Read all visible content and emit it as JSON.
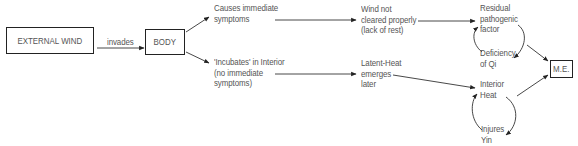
{
  "diagram": {
    "nodes": {
      "external_wind": "EXTERNAL WIND",
      "body": "BODY",
      "me": "M.E."
    },
    "edge_labels": {
      "invades": "invades"
    },
    "branch_upper": {
      "step1": "Causes immediate\nsymptoms",
      "step2": "Wind not\ncleared properly\n(lack of rest)",
      "cycle_top": "Residual\npathogenic\nfactor",
      "cycle_bottom": "Deficiency\nof Qi"
    },
    "branch_lower": {
      "step1": "'Incubates' in Interior\n(no immediate\nsymptoms)",
      "step2": "Latent-Heat\nemerges\nlater",
      "cycle_top": "Interior\nHeat",
      "cycle_bottom": "Injures\nYin"
    },
    "colors": {
      "text": "#555555",
      "lines": "#222222"
    }
  }
}
